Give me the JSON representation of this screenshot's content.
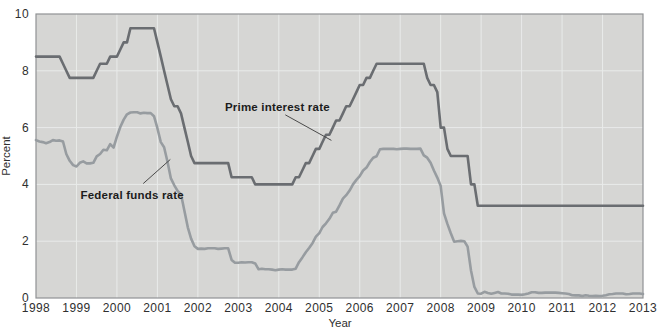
{
  "chart_data": {
    "type": "line",
    "title": "",
    "xlabel": "Year",
    "ylabel": "Percent",
    "xlim": [
      1998,
      2013
    ],
    "ylim": [
      0,
      10
    ],
    "x_ticks": [
      1998,
      1999,
      2000,
      2001,
      2002,
      2003,
      2004,
      2005,
      2006,
      2007,
      2008,
      2009,
      2010,
      2011,
      2012,
      2013
    ],
    "y_ticks": [
      0,
      2,
      4,
      6,
      8,
      10
    ],
    "grid": true,
    "legend_position": "inline-annotations",
    "x_start_year": 1998,
    "points_per_year": 12,
    "series": [
      {
        "name": "Prime interest rate",
        "color": "#6a6d71",
        "values": [
          8.5,
          8.5,
          8.5,
          8.5,
          8.5,
          8.5,
          8.5,
          8.5,
          8.25,
          8,
          7.75,
          7.75,
          7.75,
          7.75,
          7.75,
          7.75,
          7.75,
          7.75,
          8,
          8.25,
          8.25,
          8.25,
          8.5,
          8.5,
          8.5,
          8.75,
          9,
          9,
          9.5,
          9.5,
          9.5,
          9.5,
          9.5,
          9.5,
          9.5,
          9.5,
          9,
          8.5,
          8,
          7.5,
          7,
          6.75,
          6.75,
          6.5,
          6,
          5.5,
          5,
          4.75,
          4.75,
          4.75,
          4.75,
          4.75,
          4.75,
          4.75,
          4.75,
          4.75,
          4.75,
          4.75,
          4.25,
          4.25,
          4.25,
          4.25,
          4.25,
          4.25,
          4.25,
          4,
          4,
          4,
          4,
          4,
          4,
          4,
          4,
          4,
          4,
          4,
          4,
          4.25,
          4.25,
          4.5,
          4.75,
          4.75,
          5,
          5.25,
          5.25,
          5.5,
          5.75,
          5.75,
          6,
          6.25,
          6.25,
          6.5,
          6.75,
          6.75,
          7,
          7.25,
          7.5,
          7.5,
          7.75,
          7.75,
          8,
          8.25,
          8.25,
          8.25,
          8.25,
          8.25,
          8.25,
          8.25,
          8.25,
          8.25,
          8.25,
          8.25,
          8.25,
          8.25,
          8.25,
          8.25,
          7.75,
          7.5,
          7.5,
          7.25,
          6,
          6,
          5.25,
          5,
          5,
          5,
          5,
          5,
          5,
          4,
          4,
          3.25,
          3.25,
          3.25,
          3.25,
          3.25,
          3.25,
          3.25,
          3.25,
          3.25,
          3.25,
          3.25,
          3.25,
          3.25,
          3.25,
          3.25,
          3.25,
          3.25,
          3.25,
          3.25,
          3.25,
          3.25,
          3.25,
          3.25,
          3.25,
          3.25,
          3.25,
          3.25,
          3.25,
          3.25,
          3.25,
          3.25,
          3.25,
          3.25,
          3.25,
          3.25,
          3.25,
          3.25,
          3.25,
          3.25,
          3.25,
          3.25,
          3.25,
          3.25,
          3.25,
          3.25,
          3.25,
          3.25,
          3.25,
          3.25,
          3.25
        ]
      },
      {
        "name": "Federal funds rate",
        "color": "#979ca0",
        "values": [
          5.56,
          5.51,
          5.49,
          5.45,
          5.49,
          5.56,
          5.54,
          5.55,
          5.51,
          5.07,
          4.83,
          4.68,
          4.63,
          4.76,
          4.81,
          4.74,
          4.74,
          4.76,
          4.99,
          5.07,
          5.22,
          5.2,
          5.42,
          5.3,
          5.68,
          6.02,
          6.28,
          6.47,
          6.53,
          6.54,
          6.54,
          6.5,
          6.52,
          6.51,
          6.51,
          6.4,
          5.98,
          5.49,
          5.31,
          4.8,
          4.21,
          3.97,
          3.77,
          3.65,
          3.07,
          2.49,
          2.09,
          1.82,
          1.73,
          1.74,
          1.73,
          1.75,
          1.75,
          1.75,
          1.73,
          1.74,
          1.75,
          1.75,
          1.34,
          1.24,
          1.24,
          1.26,
          1.25,
          1.26,
          1.26,
          1.22,
          1.01,
          1.03,
          1.01,
          1.01,
          1,
          0.98,
          1,
          1.01,
          1,
          1,
          1,
          1.03,
          1.26,
          1.43,
          1.61,
          1.76,
          1.93,
          2.16,
          2.28,
          2.5,
          2.63,
          2.79,
          3,
          3.04,
          3.26,
          3.5,
          3.62,
          3.78,
          4,
          4.16,
          4.29,
          4.49,
          4.59,
          4.79,
          4.94,
          4.99,
          5.24,
          5.25,
          5.25,
          5.25,
          5.25,
          5.24,
          5.25,
          5.26,
          5.26,
          5.25,
          5.25,
          5.25,
          5.26,
          5.02,
          4.94,
          4.76,
          4.49,
          4.24,
          3.94,
          2.98,
          2.61,
          2.28,
          1.98,
          2,
          2.01,
          2,
          1.81,
          0.97,
          0.39,
          0.16,
          0.15,
          0.22,
          0.18,
          0.15,
          0.18,
          0.21,
          0.16,
          0.16,
          0.15,
          0.12,
          0.12,
          0.12,
          0.11,
          0.13,
          0.16,
          0.2,
          0.2,
          0.18,
          0.18,
          0.19,
          0.19,
          0.19,
          0.19,
          0.18,
          0.17,
          0.16,
          0.14,
          0.1,
          0.09,
          0.09,
          0.07,
          0.1,
          0.08,
          0.07,
          0.08,
          0.07,
          0.08,
          0.1,
          0.13,
          0.14,
          0.16,
          0.16,
          0.16,
          0.13,
          0.14,
          0.16,
          0.16,
          0.16,
          0.14
        ]
      }
    ],
    "annotations": [
      {
        "text": "Prime interest rate",
        "x": 2002.67,
        "y": 6.6,
        "leader": {
          "x1": 2004.16,
          "y1": 6.45,
          "x2": 2005.3,
          "y2": 5.55
        }
      },
      {
        "text": "Federal funds rate",
        "x": 1999.1,
        "y": 3.5,
        "leader": {
          "x1": 2000.65,
          "y1": 4.03,
          "x2": 2001.32,
          "y2": 4.88
        }
      }
    ]
  },
  "colors": {
    "page_background": "#ffffff",
    "plot_background": "#d6d6d4",
    "gridline": "#e9ebea",
    "plot_border": "#909294",
    "annotation_leader": "#4a4a4a",
    "prime_line": "#6a6d71",
    "fed_funds_line": "#979ca0",
    "text": "#2f2f2f"
  }
}
